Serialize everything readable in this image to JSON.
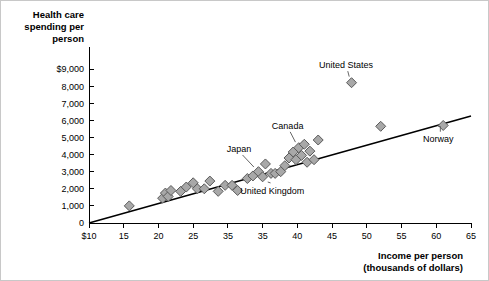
{
  "chart_data": {
    "type": "scatter",
    "title": "",
    "ylabel_lines": [
      "Health care",
      "spending per",
      "person"
    ],
    "xlabel_lines": [
      "Income per person",
      "(thousands of dollars)"
    ],
    "xlabel": "Income per person (thousands of dollars)",
    "ylabel": "Health care spending per person",
    "xlim": [
      10,
      65
    ],
    "ylim": [
      0,
      9000
    ],
    "grid": false,
    "legend": "none",
    "x_tick_labels": [
      "$10",
      "15",
      "20",
      "25",
      "35",
      "35",
      "40",
      "45",
      "50",
      "55",
      "60",
      "65"
    ],
    "x_tick_values": [
      10,
      15,
      20,
      25,
      30,
      35,
      40,
      45,
      50,
      55,
      60,
      65
    ],
    "y_tick_labels": [
      "$9,000",
      "8,000",
      "7,000",
      "6,000",
      "5,000",
      "4,000",
      "3,000",
      "2,000",
      "1,000",
      "0"
    ],
    "y_tick_values": [
      9000,
      8000,
      7000,
      6000,
      5000,
      4000,
      3000,
      2000,
      1000,
      0
    ],
    "trend_line": {
      "x_start": 10,
      "y_start": 0,
      "x_end": 65,
      "y_end": 6250
    },
    "points": [
      {
        "x": 15.8,
        "y": 1000
      },
      {
        "x": 20.6,
        "y": 1450
      },
      {
        "x": 21.0,
        "y": 1750
      },
      {
        "x": 21.4,
        "y": 1550
      },
      {
        "x": 21.8,
        "y": 1900
      },
      {
        "x": 23.2,
        "y": 1850
      },
      {
        "x": 24.0,
        "y": 2100
      },
      {
        "x": 25.0,
        "y": 2350
      },
      {
        "x": 25.6,
        "y": 2000
      },
      {
        "x": 26.6,
        "y": 2000
      },
      {
        "x": 27.4,
        "y": 2450
      },
      {
        "x": 28.6,
        "y": 1850
      },
      {
        "x": 29.6,
        "y": 2200
      },
      {
        "x": 30.6,
        "y": 2200
      },
      {
        "x": 31.4,
        "y": 1900
      },
      {
        "x": 32.8,
        "y": 2600
      },
      {
        "x": 33.6,
        "y": 2750
      },
      {
        "x": 34.4,
        "y": 3000
      },
      {
        "x": 35.0,
        "y": 2700
      },
      {
        "x": 35.4,
        "y": 3450
      },
      {
        "x": 36.2,
        "y": 2900
      },
      {
        "x": 36.8,
        "y": 2900
      },
      {
        "x": 37.6,
        "y": 3000
      },
      {
        "x": 38.2,
        "y": 3350
      },
      {
        "x": 38.8,
        "y": 3800
      },
      {
        "x": 39.4,
        "y": 4150
      },
      {
        "x": 39.8,
        "y": 3700
      },
      {
        "x": 40.2,
        "y": 4400
      },
      {
        "x": 40.6,
        "y": 3950
      },
      {
        "x": 41.0,
        "y": 4600
      },
      {
        "x": 41.4,
        "y": 3550
      },
      {
        "x": 41.8,
        "y": 4200
      },
      {
        "x": 42.4,
        "y": 3700
      },
      {
        "x": 43.0,
        "y": 4850
      },
      {
        "x": 47.8,
        "y": 8200
      },
      {
        "x": 52.0,
        "y": 5650
      },
      {
        "x": 61.0,
        "y": 5700
      }
    ],
    "annotations": [
      {
        "label": "United States",
        "label_x": 47.0,
        "label_y": 9050,
        "target_x": 47.8,
        "target_y": 8200,
        "leader": "straight"
      },
      {
        "label": "Norway",
        "label_x": 60.3,
        "label_y": 4750,
        "target_x": 61.0,
        "target_y": 5700,
        "leader": "elbow"
      },
      {
        "label": "Canada",
        "label_x": 38.6,
        "label_y": 5500,
        "target_x": 40.2,
        "target_y": 4400,
        "leader": "straight"
      },
      {
        "label": "Japan",
        "label_x": 31.6,
        "label_y": 4150,
        "target_x": 34.4,
        "target_y": 3000,
        "leader": "straight"
      },
      {
        "label": "United Kingdom",
        "label_x": 36.4,
        "label_y": 1700,
        "target_x": 35.4,
        "target_y": 2750,
        "leader": "straight"
      }
    ]
  }
}
